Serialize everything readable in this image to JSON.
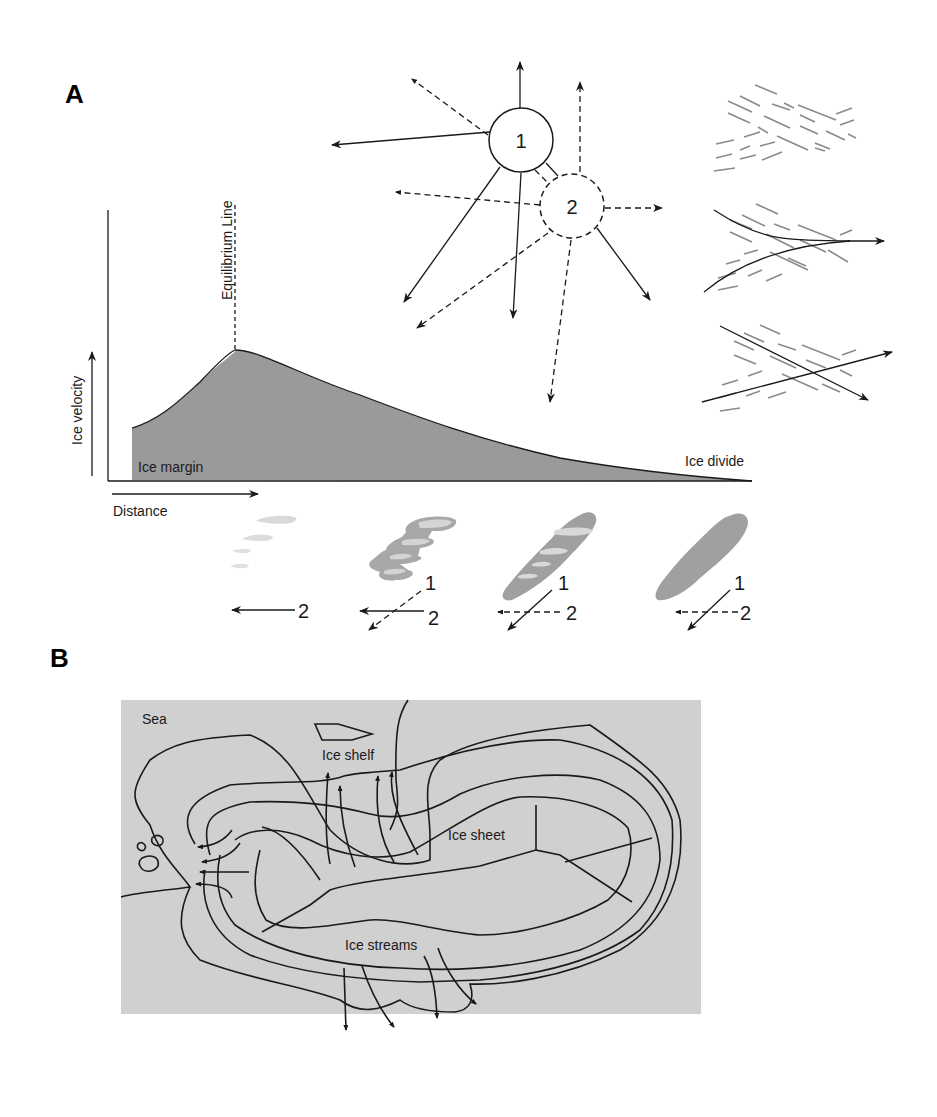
{
  "figure": {
    "panels": [
      {
        "id": "A",
        "label": "A",
        "velocity_profile": {
          "y_axis_label": "Ice velocity",
          "x_axis_label": "Distance",
          "equilibrium_line_label": "Equilibrium Line",
          "left_label": "Ice margin",
          "right_label": "Ice divide",
          "fill_color": "#9a9a9a"
        },
        "flow_directions": {
          "circle_1_label": "1",
          "circle_2_label": "2"
        },
        "bedform_sequence": [
          {
            "id": "stage-1",
            "arrow_labels": [
              "2"
            ]
          },
          {
            "id": "stage-2",
            "arrow_labels": [
              "1",
              "2"
            ]
          },
          {
            "id": "stage-3",
            "arrow_labels": [
              "1",
              "2"
            ]
          },
          {
            "id": "stage-4",
            "arrow_labels": [
              "1",
              "2"
            ]
          }
        ]
      },
      {
        "id": "B",
        "label": "B",
        "map": {
          "labels": {
            "sea": "Sea",
            "ice_shelf": "Ice shelf",
            "ice_sheet": "Ice sheet",
            "ice_streams": "Ice streams"
          },
          "background_color": "#d0d0d0"
        }
      }
    ]
  }
}
